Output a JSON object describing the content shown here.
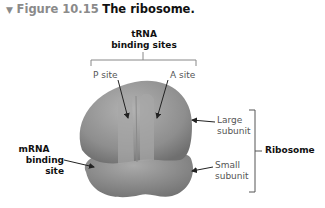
{
  "figure": {
    "number": "Figure 10.15",
    "title": "The ribosome.",
    "marker": "▼"
  },
  "labels": {
    "trna_line1": "tRNA",
    "trna_line2": "binding sites",
    "p_site": "P site",
    "a_site": "A site",
    "large_line1": "Large",
    "large_line2": "subunit",
    "small_line1": "Small",
    "small_line2": "subunit",
    "mrna_line1": "mRNA",
    "mrna_line2": "binding site",
    "ribosome": "Ribosome"
  },
  "caption": "a simplified diagram of a ribosome"
}
